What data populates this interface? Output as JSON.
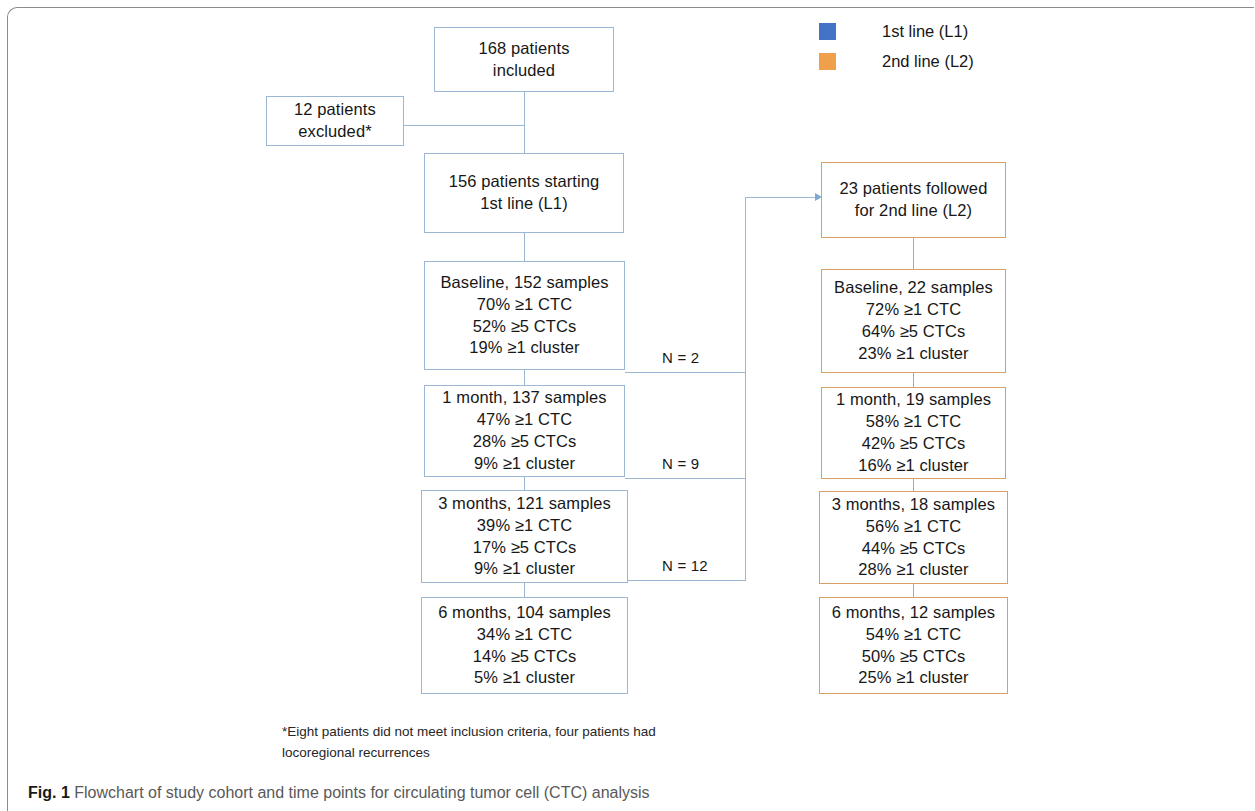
{
  "legend": {
    "items": [
      {
        "label": "1st line (L1)",
        "color": "#4472c4",
        "icon": "square-swatch-icon"
      },
      {
        "label": "2nd line (L2)",
        "color": "#f0a04b",
        "icon": "square-swatch-icon"
      }
    ]
  },
  "nodes": {
    "included": {
      "lines": [
        "168 patients",
        "included"
      ]
    },
    "excluded": {
      "lines": [
        "12 patients",
        "excluded*"
      ]
    },
    "l1_start": {
      "lines": [
        "156 patients starting",
        "1st line (L1)"
      ]
    },
    "l1_baseline": {
      "lines": [
        "Baseline, 152 samples",
        "70% ≥1 CTC",
        "52% ≥5 CTCs",
        "19% ≥1 cluster"
      ]
    },
    "l1_m1": {
      "lines": [
        "1 month, 137 samples",
        "47% ≥1 CTC",
        "28% ≥5 CTCs",
        "9% ≥1 cluster"
      ]
    },
    "l1_m3": {
      "lines": [
        "3 months, 121 samples",
        "39% ≥1 CTC",
        "17% ≥5 CTCs",
        "9% ≥1 cluster"
      ]
    },
    "l1_m6": {
      "lines": [
        "6 months, 104 samples",
        "34% ≥1 CTC",
        "14% ≥5 CTCs",
        "5% ≥1 cluster"
      ]
    },
    "l2_start": {
      "lines": [
        "23 patients followed",
        "for 2nd line (L2)"
      ]
    },
    "l2_baseline": {
      "lines": [
        "Baseline, 22 samples",
        "72% ≥1 CTC",
        "64% ≥5 CTCs",
        "23% ≥1 cluster"
      ]
    },
    "l2_m1": {
      "lines": [
        "1 month, 19 samples",
        "58% ≥1 CTC",
        "42% ≥5 CTCs",
        "16% ≥1 cluster"
      ]
    },
    "l2_m3": {
      "lines": [
        "3 months, 18 samples",
        "56% ≥1 CTC",
        "44% ≥5 CTCs",
        "28% ≥1 cluster"
      ]
    },
    "l2_m6": {
      "lines": [
        "6 months, 12 samples",
        "54% ≥1 CTC",
        "50% ≥5 CTCs",
        "25% ≥1 cluster"
      ]
    }
  },
  "branch_labels": {
    "n2": "N = 2",
    "n9": "N = 9",
    "n12": "N = 12"
  },
  "footnote": {
    "line1": "*Eight patients did not meet inclusion criteria, four patients had",
    "line2": "locoregional recurrences"
  },
  "caption": {
    "figure_number": "Fig. 1",
    "text": "Flowchart of study cohort and time points for circulating tumor cell (CTC) analysis"
  },
  "colors": {
    "l1_border": "#9bb7d4",
    "l2_border": "#d9a066",
    "frame": "#8b8b8b"
  }
}
